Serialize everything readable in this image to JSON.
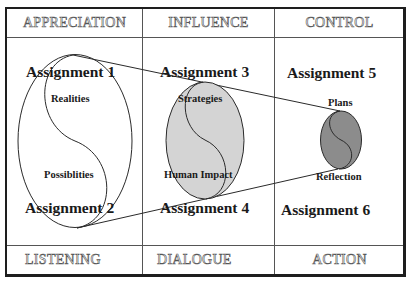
{
  "headers": {
    "top": [
      "APPRECIATION",
      "INFLUENCE",
      "CONTROL"
    ],
    "bottom": [
      "LISTENING",
      "DIALOGUE",
      "ACTION"
    ]
  },
  "assignments": [
    "Assignment  1",
    "Assignment  2",
    "Assignment  3",
    "Assignment  4",
    "Assignment  5",
    "Assignment  6"
  ],
  "ellipse_labels": {
    "large": {
      "top": "Realities",
      "bottom": "Possiblities"
    },
    "medium": {
      "top": "Strategies",
      "bottom": "Human  Impact"
    },
    "small": {
      "top": "Plans",
      "bottom": "Reflection"
    }
  },
  "colors": {
    "large_fill": "#ffffff",
    "medium_fill": "#d4d4d4",
    "small_fill": "#8c8c8c",
    "stroke": "#2a2a2a"
  }
}
